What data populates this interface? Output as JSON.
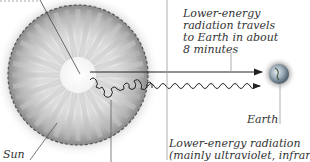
{
  "diagram": {
    "title_partial": "",
    "labels": {
      "travel": [
        "Lower-energy",
        "radiation travels",
        "to Earth in about",
        "8 minutes"
      ],
      "earth": "Earth",
      "sun": "Sun",
      "emission": [
        "Lower-energy radiation",
        "(mainly ultraviolet, infrared,"
      ]
    },
    "colors": {
      "sun_rim": "#555555",
      "sun_glow": "#9a9a9a",
      "arrow": "#222222",
      "leader": "#888888",
      "earth_blue": "#6b8fa8"
    }
  }
}
